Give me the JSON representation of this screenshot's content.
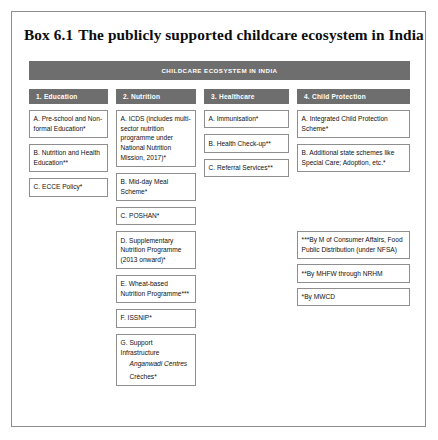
{
  "box": {
    "label": "Box 6.1",
    "title": "The publicly supported childcare ecosystem in India"
  },
  "banner": {
    "label": "CHILDCARE ECOSYSTEM IN INDIA",
    "color": "#6e6e6e",
    "text_color": "#ffffff"
  },
  "columns": [
    {
      "id": "education",
      "header": "1. Education",
      "items": [
        {
          "text": "A. Pre-school and Non-formal Education*"
        },
        {
          "text": "B. Nutrition and Health Education**"
        },
        {
          "text": "C. ECCE Policy*"
        }
      ]
    },
    {
      "id": "nutrition",
      "header": "2. Nutrition",
      "items": [
        {
          "text": "A. ICDS (includes multi-sector nutrition programme under National Nutrition Mission, 2017)*"
        },
        {
          "text": "B. Mid-day Meal Scheme*"
        },
        {
          "text": "C. POSHAN*"
        },
        {
          "text": "D. Supplementary Nutrition Programme (2013 onward)*"
        },
        {
          "text": "E. Wheat-based Nutrition Programme***"
        },
        {
          "text": "F. ISSNIP*"
        },
        {
          "text": "G. Support Infrastructure",
          "italic_sub": "Anganwadi Centres",
          "plain_sub": "Crèches*"
        }
      ]
    },
    {
      "id": "healthcare",
      "header": "3. Healthcare",
      "items": [
        {
          "text": "A. Immunisation*"
        },
        {
          "text": "B. Health Check-up**"
        },
        {
          "text": "C. Referral Services**"
        }
      ]
    },
    {
      "id": "child-protection",
      "header": "4. Child Protection",
      "items": [
        {
          "text": "A. Integrated Child Protection Scheme*"
        },
        {
          "text": "B. Additional state schemes like Special Care; Adoption, etc.*"
        }
      ],
      "notes": [
        {
          "text": "***By M of Consumer Affairs, Food Public Distribution (under NFSA)"
        },
        {
          "text": "**By MHFW through NRHM"
        },
        {
          "text": "*By MWCD"
        }
      ]
    }
  ],
  "style": {
    "border_color": "#8e8e8e",
    "page_background": "#ffffff"
  }
}
